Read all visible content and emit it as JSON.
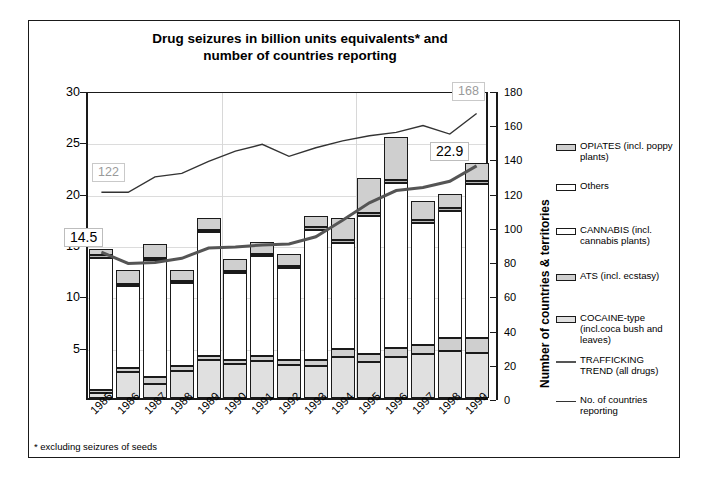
{
  "figure": {
    "title_line1": "Drug seizures in billion units equivalents* and",
    "title_line2": "number of countries reporting",
    "footnote": "* excluding seizures of seeds"
  },
  "axes": {
    "y_left_title": "billion units",
    "y_left_ticks": [
      "5",
      "10",
      "15",
      "20",
      "25",
      "30"
    ],
    "y_right_title": "Number of countries & territories",
    "y_right_ticks": [
      "0",
      "20",
      "40",
      "60",
      "80",
      "100",
      "120",
      "140",
      "160",
      "180"
    ]
  },
  "annotations": [
    {
      "name": "countries-start",
      "text": "122",
      "style": "grey"
    },
    {
      "name": "countries-end",
      "text": "168",
      "style": "grey"
    },
    {
      "name": "seizures-start",
      "text": "14.5",
      "style": "dark"
    },
    {
      "name": "seizures-end",
      "text": "22.9",
      "style": "dark"
    }
  ],
  "legend": [
    {
      "label": "OPIATES (incl. poppy plants)",
      "swatch": "bar",
      "color": "#cfcfcf"
    },
    {
      "label": "Others",
      "swatch": "bar",
      "color": "#ffffff"
    },
    {
      "label": "CANNABIS (incl. cannabis plants)",
      "swatch": "bar",
      "color": "#ffffff"
    },
    {
      "label": "ATS (incl. ecstasy)",
      "swatch": "bar",
      "color": "#cfcfcf"
    },
    {
      "label": "COCAINE-type (incl.coca bush and leaves)",
      "swatch": "bar",
      "color": "#e0e0e0"
    },
    {
      "label": "TRAFFICKING TREND (all drugs)",
      "swatch": "line-thick",
      "color": "#555555"
    },
    {
      "label": "No. of countries reporting",
      "swatch": "line-thin",
      "color": "#333333"
    }
  ],
  "chart_data": {
    "type": "bar",
    "title": "Drug seizures in billion units equivalents* and number of countries reporting",
    "xlabel": "",
    "ylabel": "billion units",
    "y2label": "Number of countries & territories",
    "ylim": [
      0,
      30
    ],
    "y2lim": [
      0,
      180
    ],
    "grid": true,
    "legend_position": "right",
    "categories": [
      "1985",
      "1986",
      "1987",
      "1988",
      "1989",
      "1990",
      "1991",
      "1992",
      "1993",
      "1994",
      "1995",
      "1996",
      "1997",
      "1998",
      "1999"
    ],
    "series": [
      {
        "name": "COCAINE-type (incl.coca bush and leaves)",
        "values": [
          0.5,
          2.5,
          1.4,
          2.6,
          3.7,
          3.3,
          3.6,
          3.2,
          3.1,
          4.0,
          3.5,
          4.0,
          4.3,
          4.6,
          4.4
        ]
      },
      {
        "name": "ATS (incl. ecstasy)",
        "values": [
          0.3,
          0.4,
          0.6,
          0.5,
          0.4,
          0.4,
          0.5,
          0.5,
          0.6,
          0.8,
          0.8,
          0.9,
          0.9,
          1.2,
          1.4
        ]
      },
      {
        "name": "CANNABIS (incl. cannabis plants)",
        "values": [
          12.8,
          8.0,
          11.4,
          8.1,
          12.1,
          8.5,
          9.7,
          9.0,
          12.7,
          10.3,
          13.4,
          16.0,
          11.8,
          12.4,
          15.0
        ]
      },
      {
        "name": "Others",
        "values": [
          0.3,
          0.2,
          0.2,
          0.2,
          0.2,
          0.2,
          0.2,
          0.2,
          0.3,
          0.3,
          0.3,
          0.3,
          0.3,
          0.3,
          0.3
        ]
      },
      {
        "name": "OPIATES (incl. poppy plants)",
        "values": [
          0.6,
          1.4,
          1.4,
          1.1,
          1.1,
          1.1,
          1.2,
          1.1,
          1.0,
          2.1,
          3.4,
          4.2,
          1.9,
          1.4,
          1.8
        ]
      }
    ],
    "totals": [
      14.5,
      12.5,
      15.0,
      12.5,
      17.5,
      13.5,
      15.2,
      14.0,
      17.7,
      17.5,
      21.4,
      25.4,
      19.2,
      19.9,
      22.9
    ],
    "trend_trafficking": {
      "name": "TRAFFICKING TREND (all drugs)",
      "axis": "left",
      "values": [
        14.5,
        13.4,
        13.5,
        13.9,
        14.9,
        15.0,
        15.2,
        15.3,
        16.0,
        17.6,
        19.3,
        20.5,
        20.8,
        21.4,
        22.9
      ]
    },
    "trend_countries": {
      "name": "No. of countries reporting",
      "axis": "right",
      "values": [
        122,
        122,
        131,
        133,
        140,
        146,
        150,
        143,
        148,
        152,
        155,
        157,
        161,
        156,
        168
      ],
      "start_label": 122,
      "end_label": 168
    }
  }
}
